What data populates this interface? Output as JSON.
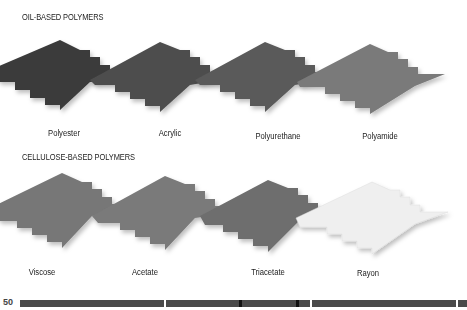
{
  "sections": [
    {
      "title": "OIL-BASED POLYMERS",
      "items": [
        {
          "label": "Polyester",
          "color": "#3a3a3a"
        },
        {
          "label": "Acrylic",
          "color": "#4e4e4e"
        },
        {
          "label": "Polyurethane",
          "color": "#5a5a5a"
        },
        {
          "label": "Polyamide",
          "color": "#7a7a7a"
        }
      ]
    },
    {
      "title": "CELLULOSE-BASED POLYMERS",
      "items": [
        {
          "label": "Viscose",
          "color": "#777777"
        },
        {
          "label": "Acetate",
          "color": "#7a7a7a"
        },
        {
          "label": "Triacetate",
          "color": "#6e6e6e"
        },
        {
          "label": "Rayon",
          "color": "#efefef"
        }
      ]
    }
  ],
  "footer": {
    "page_number": "50"
  }
}
